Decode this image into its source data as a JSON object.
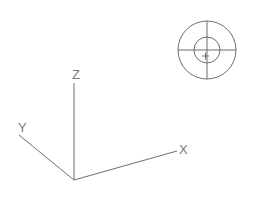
{
  "compass": {
    "center": [
      207,
      50
    ],
    "outer_radius": 29,
    "inner_radius": 13,
    "cursor_marker": "+",
    "cursor_position": [
      206,
      55
    ]
  },
  "axis_tripod": {
    "origin": [
      74,
      180
    ],
    "x_axis": {
      "label": "X",
      "end": [
        177,
        151
      ]
    },
    "y_axis": {
      "label": "Y",
      "end": [
        19,
        135
      ]
    },
    "z_axis": {
      "label": "Z",
      "end": [
        74,
        83
      ]
    }
  },
  "colors": {
    "background": "#ffffff",
    "line": "#6e6e6e"
  }
}
